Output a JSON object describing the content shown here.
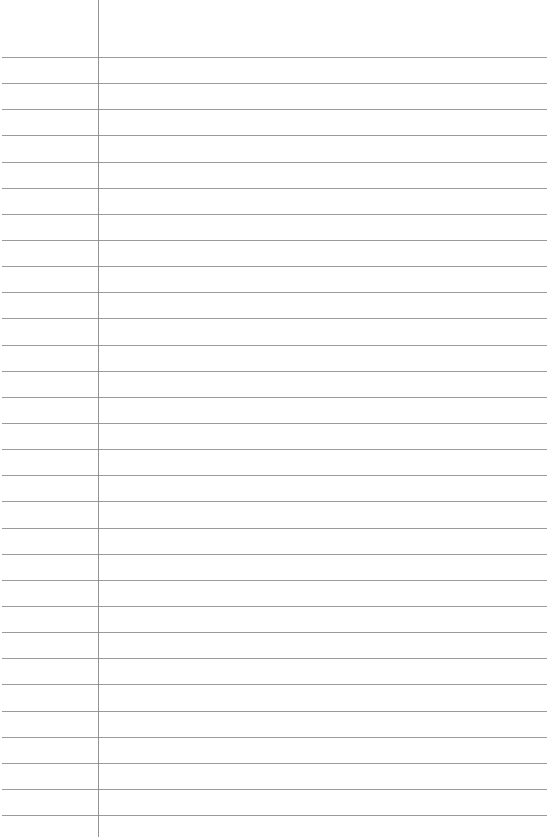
{
  "page": {
    "type": "lined-paper",
    "line_count": 30,
    "first_line_y": 57,
    "line_spacing": 26.14,
    "margin_x": 98,
    "line_color": "#8a8a8a",
    "background": "#ffffff"
  }
}
